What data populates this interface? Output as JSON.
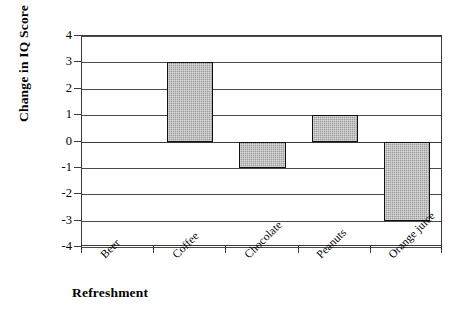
{
  "chart_data": {
    "type": "bar",
    "title": "",
    "subtitle": "",
    "xlabel": "Refreshment",
    "ylabel": "Change in IQ Score",
    "categories": [
      "Beer",
      "Coffee",
      "Chocolate",
      "Peanuts",
      "Orange juice"
    ],
    "values": [
      0,
      3,
      -1,
      1,
      -3
    ],
    "series": [
      {
        "name": "Change in IQ Score",
        "values": [
          0,
          3,
          -1,
          1,
          -3
        ]
      }
    ],
    "ylim": [
      -4,
      4
    ],
    "yticks": [
      4,
      3,
      2,
      1,
      0,
      -1,
      -2,
      -3,
      -4
    ],
    "ytick_labels": [
      "4",
      "3",
      "2",
      "1",
      "0",
      "-1",
      "-2",
      "-3",
      "-4"
    ],
    "grid": true,
    "grid_axis": "y",
    "legend": "none",
    "legend_position": "none",
    "annotations": [],
    "bar_fill_color": "#9b9b9b",
    "bar_edge_color": "#111111",
    "plot_background_color": "#ffffff",
    "axis_color": "#3a3a3a",
    "xtick_label_rotation": -45
  }
}
